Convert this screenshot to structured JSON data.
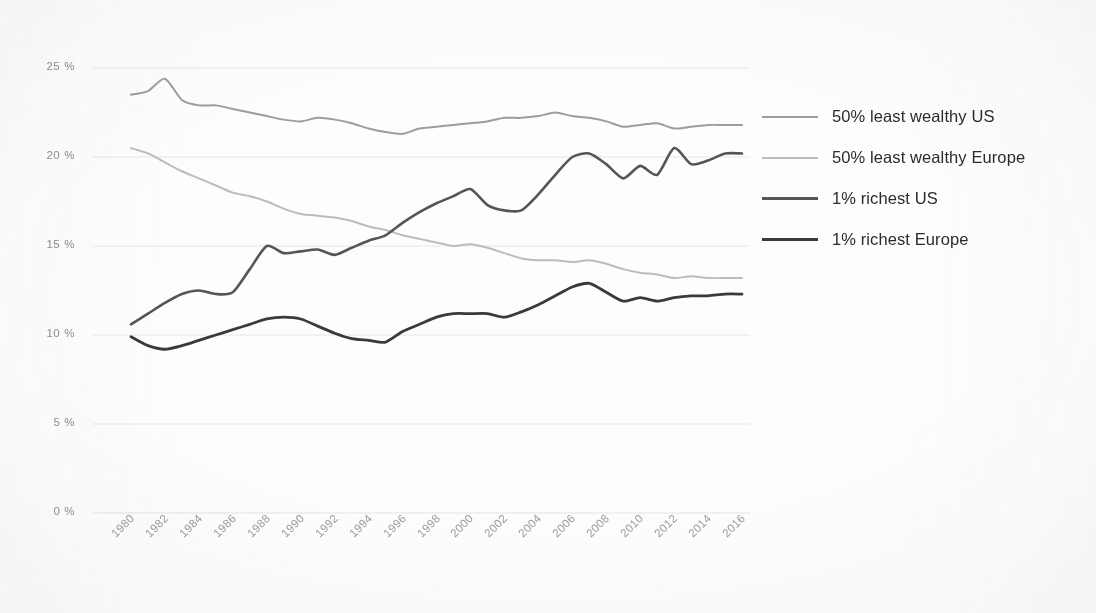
{
  "chart_data": {
    "type": "line",
    "title": "",
    "xlabel": "",
    "ylabel": "",
    "ylim": [
      0,
      25
    ],
    "xlim": [
      1980,
      2016
    ],
    "grid": true,
    "legend_position": "right",
    "ytick_labels": [
      "25 %",
      "20 %",
      "15 %",
      "10 %",
      "5 %",
      "0 %"
    ],
    "ytick_values": [
      25,
      20,
      15,
      10,
      5,
      0
    ],
    "x": [
      1980,
      1981,
      1982,
      1983,
      1984,
      1985,
      1986,
      1987,
      1988,
      1989,
      1990,
      1991,
      1992,
      1993,
      1994,
      1995,
      1996,
      1997,
      1998,
      1999,
      2000,
      2001,
      2002,
      2003,
      2004,
      2005,
      2006,
      2007,
      2008,
      2009,
      2010,
      2011,
      2012,
      2013,
      2014,
      2015,
      2016
    ],
    "xtick_labels": [
      "1980",
      "1982",
      "1984",
      "1986",
      "1988",
      "1990",
      "1992",
      "1994",
      "1996",
      "1998",
      "2000",
      "2002",
      "2004",
      "2006",
      "2008",
      "2010",
      "2012",
      "2014",
      "2016"
    ],
    "series": [
      {
        "name": "50% least wealthy US",
        "color": "#9d9d9d",
        "width": 2.0,
        "values": [
          23.5,
          23.7,
          24.4,
          23.2,
          22.9,
          22.9,
          22.7,
          22.5,
          22.3,
          22.1,
          22.0,
          22.2,
          22.1,
          21.9,
          21.6,
          21.4,
          21.3,
          21.6,
          21.7,
          21.8,
          21.9,
          22.0,
          22.2,
          22.2,
          22.3,
          22.5,
          22.3,
          22.2,
          22.0,
          21.7,
          21.8,
          21.9,
          21.6,
          21.7,
          21.8,
          21.8,
          21.8
        ]
      },
      {
        "name": "50% least wealthy Europe",
        "color": "#bcbcbc",
        "width": 2.0,
        "values": [
          20.5,
          20.2,
          19.7,
          19.2,
          18.8,
          18.4,
          18.0,
          17.8,
          17.5,
          17.1,
          16.8,
          16.7,
          16.6,
          16.4,
          16.1,
          15.9,
          15.6,
          15.4,
          15.2,
          15.0,
          15.1,
          14.9,
          14.6,
          14.3,
          14.2,
          14.2,
          14.1,
          14.2,
          14.0,
          13.7,
          13.5,
          13.4,
          13.2,
          13.3,
          13.2,
          13.2,
          13.2
        ]
      },
      {
        "name": "1% richest US",
        "color": "#555555",
        "width": 2.6,
        "values": [
          10.6,
          11.2,
          11.8,
          12.3,
          12.5,
          12.3,
          12.4,
          13.7,
          15.0,
          14.6,
          14.7,
          14.8,
          14.5,
          14.9,
          15.3,
          15.6,
          16.3,
          16.9,
          17.4,
          17.8,
          18.2,
          17.3,
          17.0,
          17.0,
          17.9,
          19.0,
          20.0,
          20.2,
          19.6,
          18.8,
          19.5,
          19.0,
          20.5,
          19.6,
          19.8,
          20.2,
          20.2
        ]
      },
      {
        "name": "1% richest Europe",
        "color": "#3a3a3a",
        "width": 2.8,
        "values": [
          9.9,
          9.4,
          9.2,
          9.4,
          9.7,
          10.0,
          10.3,
          10.6,
          10.9,
          11.0,
          10.9,
          10.5,
          10.1,
          9.8,
          9.7,
          9.6,
          10.2,
          10.6,
          11.0,
          11.2,
          11.2,
          11.2,
          11.0,
          11.3,
          11.7,
          12.2,
          12.7,
          12.9,
          12.4,
          11.9,
          12.1,
          11.9,
          12.1,
          12.2,
          12.2,
          12.3,
          12.3
        ]
      }
    ]
  },
  "legend": {
    "items": [
      {
        "label": "50% least wealthy US"
      },
      {
        "label": "50% least wealthy Europe"
      },
      {
        "label": "1% richest US"
      },
      {
        "label": "1% richest Europe"
      }
    ]
  }
}
